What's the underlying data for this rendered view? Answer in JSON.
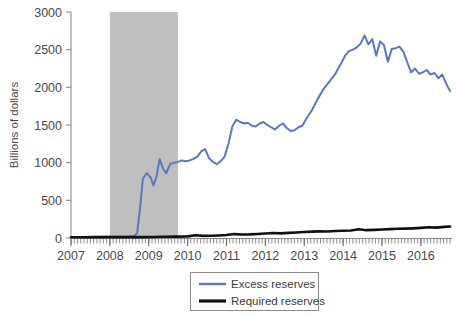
{
  "chart_data": {
    "type": "line",
    "title": "",
    "xlabel": "",
    "ylabel": "Billions of dollars",
    "xlim": [
      2007.0,
      2016.8
    ],
    "ylim": [
      0,
      3000
    ],
    "grid": false,
    "legend_position": "bottom-center",
    "y_ticks": [
      0,
      500,
      1000,
      1500,
      2000,
      2500,
      3000
    ],
    "y_tick_labels": [
      "0",
      "500",
      "1000",
      "1500",
      "2000",
      "2500",
      "3000"
    ],
    "x_ticks": [
      2007,
      2008,
      2009,
      2010,
      2011,
      2012,
      2013,
      2014,
      2015,
      2016
    ],
    "x_tick_labels": [
      "2007",
      "2008",
      "2009",
      "2010",
      "2011",
      "2012",
      "2013",
      "2014",
      "2015",
      "2016"
    ],
    "annotations": [
      {
        "name": "recession-shading",
        "type": "vspan",
        "x_start": 2008.0,
        "x_end": 2009.75,
        "color": "#bfbfbf",
        "label": ""
      }
    ],
    "series": [
      {
        "name": "Excess reserves",
        "color": "#5b78bd",
        "width": 2.0,
        "x": [
          2007.0,
          2007.15,
          2007.3,
          2007.45,
          2007.6,
          2007.75,
          2007.9,
          2008.05,
          2008.2,
          2008.35,
          2008.5,
          2008.62,
          2008.7,
          2008.78,
          2008.85,
          2008.95,
          2009.05,
          2009.12,
          2009.2,
          2009.28,
          2009.36,
          2009.45,
          2009.55,
          2009.65,
          2009.75,
          2009.85,
          2009.95,
          2010.05,
          2010.15,
          2010.25,
          2010.35,
          2010.45,
          2010.55,
          2010.65,
          2010.75,
          2010.85,
          2010.95,
          2011.05,
          2011.15,
          2011.25,
          2011.35,
          2011.45,
          2011.55,
          2011.65,
          2011.75,
          2011.85,
          2011.95,
          2012.05,
          2012.15,
          2012.25,
          2012.35,
          2012.45,
          2012.55,
          2012.65,
          2012.75,
          2012.85,
          2012.95,
          2013.05,
          2013.2,
          2013.35,
          2013.5,
          2013.65,
          2013.8,
          2013.95,
          2014.05,
          2014.15,
          2014.25,
          2014.35,
          2014.45,
          2014.55,
          2014.65,
          2014.75,
          2014.85,
          2014.95,
          2015.05,
          2015.15,
          2015.25,
          2015.35,
          2015.45,
          2015.55,
          2015.65,
          2015.75,
          2015.85,
          2015.95,
          2016.05,
          2016.15,
          2016.25,
          2016.35,
          2016.45,
          2016.55,
          2016.65,
          2016.75
        ],
        "y": [
          12,
          12,
          14,
          13,
          14,
          13,
          15,
          16,
          16,
          18,
          20,
          25,
          60,
          420,
          790,
          860,
          800,
          700,
          820,
          1050,
          930,
          860,
          980,
          1000,
          1010,
          1030,
          1020,
          1030,
          1050,
          1080,
          1150,
          1180,
          1060,
          1010,
          980,
          1020,
          1080,
          1250,
          1480,
          1570,
          1540,
          1520,
          1530,
          1490,
          1480,
          1520,
          1540,
          1500,
          1470,
          1440,
          1490,
          1520,
          1460,
          1420,
          1430,
          1470,
          1490,
          1580,
          1700,
          1850,
          1980,
          2080,
          2180,
          2320,
          2420,
          2480,
          2500,
          2530,
          2580,
          2690,
          2570,
          2640,
          2420,
          2610,
          2560,
          2340,
          2510,
          2520,
          2540,
          2470,
          2330,
          2200,
          2250,
          2180,
          2200,
          2230,
          2170,
          2190,
          2120,
          2170,
          2050,
          1950
        ]
      },
      {
        "name": "Required reserves",
        "color": "#111111",
        "width": 2.6,
        "x": [
          2007.0,
          2007.3,
          2007.6,
          2007.9,
          2008.2,
          2008.5,
          2008.8,
          2009.1,
          2009.4,
          2009.7,
          2010.0,
          2010.2,
          2010.4,
          2010.6,
          2010.8,
          2011.0,
          2011.2,
          2011.4,
          2011.6,
          2011.8,
          2012.0,
          2012.2,
          2012.4,
          2012.6,
          2012.8,
          2013.0,
          2013.2,
          2013.4,
          2013.6,
          2013.8,
          2014.0,
          2014.2,
          2014.4,
          2014.6,
          2014.8,
          2015.0,
          2015.2,
          2015.4,
          2015.6,
          2015.8,
          2016.0,
          2016.2,
          2016.4,
          2016.6,
          2016.75
        ],
        "y": [
          10,
          10,
          11,
          11,
          11,
          11,
          12,
          14,
          16,
          18,
          22,
          36,
          28,
          30,
          34,
          40,
          52,
          46,
          48,
          54,
          60,
          66,
          62,
          68,
          74,
          80,
          84,
          88,
          86,
          92,
          96,
          100,
          116,
          104,
          108,
          112,
          118,
          122,
          124,
          128,
          134,
          142,
          138,
          148,
          152
        ]
      }
    ]
  },
  "axis": {
    "y_title": "Billions of dollars"
  },
  "legend": {
    "items": [
      {
        "label": "Excess reserves",
        "color": "#5b78bd",
        "swatch": "line-swatch-blue"
      },
      {
        "label": "Required reserves",
        "color": "#111111",
        "swatch": "line-swatch-black"
      }
    ]
  }
}
